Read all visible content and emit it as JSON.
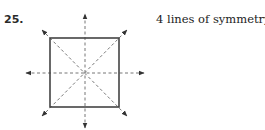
{
  "problem": {
    "number": "25.",
    "answer": "4 lines of symmetry"
  },
  "figure": {
    "shape": "square",
    "lines_of_symmetry": 4,
    "axes": [
      "vertical",
      "horizontal",
      "diagonal-main",
      "diagonal-anti"
    ],
    "colors": {
      "square_stroke": "#444444",
      "axis_stroke": "#777777",
      "arrowhead": "#333333"
    }
  }
}
